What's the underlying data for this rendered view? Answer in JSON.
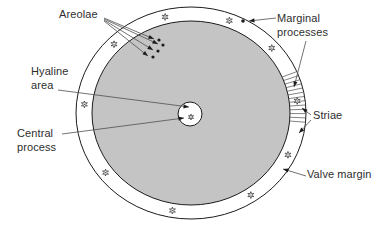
{
  "labels": {
    "areolae": "Areolae",
    "marginal_processes": "Marginal processes",
    "hyaline_area": "Hyaline area",
    "central_process": "Central process",
    "striae": "Striae",
    "valve_margin": "Valve margin"
  },
  "colors": {
    "valve_face_fill": "#c4c4c4",
    "ring_fill": "#ffffff",
    "outline": "#1c1c1c",
    "leader": "#4f4f4f",
    "label_text": "#2e2e2e",
    "marker": "#1c1c1c"
  },
  "diagram": {
    "center": {
      "x": 191,
      "y": 113
    },
    "outer_ellipse": {
      "rx": 115,
      "ry": 106
    },
    "inner_ellipse": {
      "rx": 99,
      "ry": 92
    },
    "hyaline_circle": {
      "cx": 190,
      "cy": 114,
      "r": 12
    },
    "star_mid_radii": {
      "rx": 107,
      "ry": 99
    },
    "marginal_process_angles_deg": [
      104,
      69,
      41,
      7,
      335,
      304,
      260,
      217,
      175,
      136
    ],
    "marginal_process_dot": {
      "x": 243,
      "y": 21
    },
    "central_process_star": {
      "x": 191,
      "y": 117
    },
    "areolae_dots": [
      {
        "x": 159,
        "y": 40
      },
      {
        "x": 163,
        "y": 45
      },
      {
        "x": 158,
        "y": 51
      },
      {
        "x": 153,
        "y": 57
      }
    ],
    "striae_band": {
      "start_deg": -23,
      "end_deg": 5,
      "line_count": 13
    },
    "leaders": [
      {
        "name": "areolae-pointer-1",
        "x1": 104,
        "y1": 18,
        "x2": 154,
        "y2": 39,
        "arrow": true
      },
      {
        "name": "areolae-pointer-2",
        "x1": 104,
        "y1": 19,
        "x2": 158,
        "y2": 44,
        "arrow": true
      },
      {
        "name": "areolae-pointer-3",
        "x1": 104,
        "y1": 20,
        "x2": 153,
        "y2": 50,
        "arrow": true
      },
      {
        "name": "areolae-pointer-4",
        "x1": 104,
        "y1": 21,
        "x2": 148,
        "y2": 56,
        "arrow": true
      },
      {
        "name": "hyaline-pointer",
        "x1": 58,
        "y1": 90,
        "x2": 189,
        "y2": 107,
        "arrow": true
      },
      {
        "name": "central-process-pointer",
        "x1": 62,
        "y1": 134,
        "x2": 184,
        "y2": 118,
        "arrow": true
      },
      {
        "name": "marginal-top-pointer",
        "x1": 276,
        "y1": 18,
        "x2": 249,
        "y2": 21,
        "arrow": true
      },
      {
        "name": "marginal-right-pointer",
        "x1": 306,
        "y1": 41,
        "x2": 294,
        "y2": 87,
        "arrow": true
      },
      {
        "name": "striae-pointer-1",
        "x1": 311,
        "y1": 115,
        "x2": 302,
        "y2": 108,
        "arrow": true
      },
      {
        "name": "striae-pointer-2",
        "x1": 311,
        "y1": 120,
        "x2": 299,
        "y2": 133,
        "arrow": true
      },
      {
        "name": "valve-margin-pointer",
        "x1": 306,
        "y1": 176,
        "x2": 283,
        "y2": 169,
        "arrow": true
      }
    ]
  }
}
